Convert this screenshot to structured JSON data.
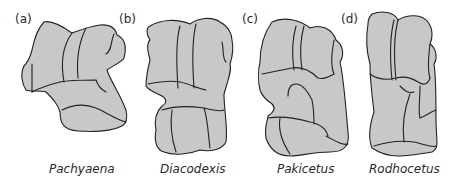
{
  "figure": {
    "panels": [
      {
        "label": "(a)",
        "taxon": "Pachyaena"
      },
      {
        "label": "(b)",
        "taxon": "Diacodexis"
      },
      {
        "label": "(c)",
        "taxon": "Pakicetus"
      },
      {
        "label": "(d)",
        "taxon": "Rodhocetus"
      }
    ],
    "colors": {
      "bone_fill": "#c8c8c8",
      "outline": "#222222",
      "text": "#2a2a2a"
    }
  }
}
